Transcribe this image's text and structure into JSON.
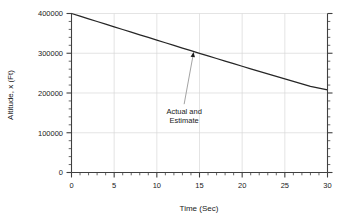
{
  "chart_data": {
    "type": "line",
    "title": "",
    "xlabel": "Time (Sec)",
    "ylabel": "Altitude, x (Ft)",
    "xlim": [
      0,
      30
    ],
    "ylim": [
      0,
      400000
    ],
    "grid": true,
    "legend_position": "none",
    "x_ticks": [
      0,
      5,
      10,
      15,
      20,
      25,
      30
    ],
    "x_tick_labels": [
      "0",
      "5",
      "10",
      "15",
      "20",
      "25",
      "30"
    ],
    "x_minor_tick_step": 1,
    "y_ticks": [
      0,
      100000,
      200000,
      300000,
      400000
    ],
    "y_tick_labels": [
      "0",
      "100000",
      "200000",
      "300000",
      "400000"
    ],
    "y_minor_tick_step": 20000,
    "series": [
      {
        "name": "Actual and Estimate",
        "color": "#262626",
        "x": [
          0,
          1,
          2,
          3,
          4,
          5,
          6,
          7,
          8,
          9,
          10,
          11,
          12,
          13,
          14,
          15,
          16,
          17,
          18,
          19,
          20,
          21,
          22,
          23,
          24,
          25,
          26,
          27,
          28,
          29,
          30
        ],
        "values": [
          400000,
          393300,
          386600,
          379900,
          373200,
          366500,
          359800,
          353100,
          346400,
          339700,
          333000,
          326400,
          319700,
          313100,
          306500,
          299900,
          293300,
          286800,
          280300,
          273800,
          267300,
          260900,
          254500,
          248100,
          241800,
          235500,
          229200,
          223000,
          216800,
          212300,
          208000
        ]
      }
    ],
    "annotations": [
      {
        "text_lines": [
          "Actual and",
          "Estimate"
        ],
        "text_x": 13.2,
        "text_y": 148000,
        "point_x": 14.3,
        "point_y": 303000
      }
    ]
  },
  "figure": {
    "background_color": "#ffffff",
    "axis_color": "#404040",
    "grid_color": "#d9d9d9",
    "text_color": "#1a1a1a"
  }
}
